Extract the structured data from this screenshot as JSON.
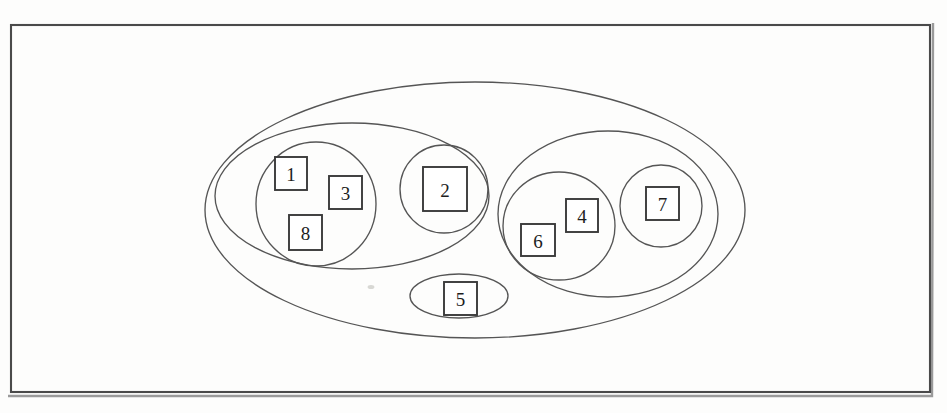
{
  "figure": {
    "kind": "nested-set-diagram",
    "background_color": "#fdfdfc",
    "line_color": "#555555",
    "box_line_color": "#3a3a3a",
    "frame_color": "#4a4a4a"
  },
  "frame": {
    "x": 11,
    "y": 25,
    "width": 919,
    "height": 367
  },
  "containers": [
    {
      "id": "outer-ellipse",
      "role": "root-set",
      "cx": 475,
      "cy": 210,
      "rx": 270,
      "ry": 128
    },
    {
      "id": "left-group-ellipse",
      "role": "subset-left",
      "cx": 352,
      "cy": 196,
      "rx": 137,
      "ry": 73
    },
    {
      "id": "right-group-ellipse",
      "role": "subset-right",
      "cx": 608,
      "cy": 214,
      "rx": 110,
      "ry": 83
    },
    {
      "id": "node5-ellipse",
      "role": "singleton-set",
      "cx": 459,
      "cy": 296,
      "rx": 49,
      "ry": 22
    },
    {
      "id": "circle-138",
      "role": "leaf-set",
      "cx": 316,
      "cy": 204,
      "rx": 60,
      "ry": 62
    },
    {
      "id": "circle-2",
      "role": "leaf-set",
      "cx": 444,
      "cy": 189,
      "rx": 44,
      "ry": 44
    },
    {
      "id": "circle-64",
      "role": "leaf-set",
      "cx": 559,
      "cy": 226,
      "rx": 56,
      "ry": 54
    },
    {
      "id": "circle-7",
      "role": "leaf-set",
      "cx": 661,
      "cy": 206,
      "rx": 41,
      "ry": 41
    }
  ],
  "nodes": [
    {
      "label": "1",
      "x": 275,
      "y": 157,
      "width": 32,
      "height": 33,
      "parent": "circle-138"
    },
    {
      "label": "3",
      "x": 329,
      "y": 176,
      "width": 33,
      "height": 33,
      "parent": "circle-138"
    },
    {
      "label": "8",
      "x": 289,
      "y": 215,
      "width": 33,
      "height": 35,
      "parent": "circle-138"
    },
    {
      "label": "2",
      "x": 423,
      "y": 167,
      "width": 44,
      "height": 44,
      "parent": "circle-2"
    },
    {
      "label": "6",
      "x": 521,
      "y": 224,
      "width": 34,
      "height": 32,
      "parent": "circle-64"
    },
    {
      "label": "4",
      "x": 566,
      "y": 199,
      "width": 32,
      "height": 33,
      "parent": "circle-64"
    },
    {
      "label": "7",
      "x": 646,
      "y": 187,
      "width": 33,
      "height": 33,
      "parent": "circle-7"
    },
    {
      "label": "5",
      "x": 444,
      "y": 282,
      "width": 33,
      "height": 33,
      "parent": "node5-ellipse"
    }
  ],
  "chart_data": {
    "type": "diagram",
    "title": "",
    "subtype": "nested set / Venn-style hierarchy",
    "hierarchy": {
      "root": "outer-ellipse",
      "members": [
        "1",
        "2",
        "3",
        "4",
        "5",
        "6",
        "7",
        "8"
      ],
      "children": [
        {
          "id": "left-group-ellipse",
          "members": [
            "1",
            "3",
            "8",
            "2"
          ],
          "children": [
            {
              "id": "circle-138",
              "members": [
                "1",
                "3",
                "8"
              ]
            },
            {
              "id": "circle-2",
              "members": [
                "2"
              ]
            }
          ]
        },
        {
          "id": "right-group-ellipse",
          "members": [
            "6",
            "4",
            "7"
          ],
          "children": [
            {
              "id": "circle-64",
              "members": [
                "6",
                "4"
              ]
            },
            {
              "id": "circle-7",
              "members": [
                "7"
              ]
            }
          ]
        },
        {
          "id": "node5-ellipse",
          "members": [
            "5"
          ],
          "children": []
        }
      ]
    },
    "node_labels": [
      "1",
      "2",
      "3",
      "4",
      "5",
      "6",
      "7",
      "8"
    ],
    "grid": false,
    "legend": null,
    "xlabel": "",
    "ylabel": ""
  }
}
